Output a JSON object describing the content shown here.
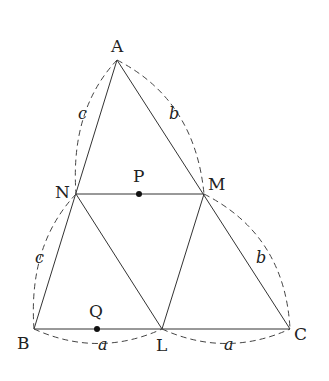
{
  "diagram": {
    "type": "geometry-triangle-midpoints",
    "points": {
      "A": {
        "label": "A",
        "x": 117,
        "y": 60
      },
      "N": {
        "label": "N",
        "x": 76,
        "y": 194
      },
      "M": {
        "label": "M",
        "x": 204,
        "y": 194
      },
      "B": {
        "label": "B",
        "x": 34,
        "y": 329
      },
      "L": {
        "label": "L",
        "x": 162,
        "y": 329
      },
      "C": {
        "label": "C",
        "x": 290,
        "y": 329
      },
      "P": {
        "label": "P",
        "x": 139,
        "y": 194
      },
      "Q": {
        "label": "Q",
        "x": 97,
        "y": 329
      }
    },
    "side_labels": {
      "c_upper": "c",
      "c_lower": "c",
      "b_upper": "b",
      "b_lower": "b",
      "a_left": "a",
      "a_right": "a"
    },
    "line_color": "#333333",
    "dash_color": "#444444"
  }
}
